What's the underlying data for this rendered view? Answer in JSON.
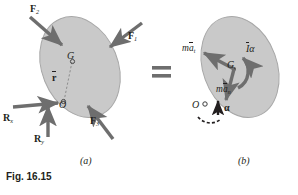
{
  "figure": {
    "caption": "Fig. 16.15",
    "part_a_label": "(a)",
    "part_b_label": "(b)",
    "equals_sign": "=",
    "colors": {
      "body_fill": "#c9c9c9",
      "body_stroke": "#9a9a9a",
      "arrow": "#6e6e6e",
      "text": "#231f20",
      "page_background": "#ffffff"
    }
  },
  "part_a": {
    "title": "(a)",
    "description": "Rigid body acted upon by external forces and reactions",
    "body_shape": "tilted-ellipse",
    "points": [
      {
        "name": "center-of-gravity",
        "label": "G"
      },
      {
        "name": "point-o",
        "label": "O"
      }
    ],
    "position_vector": {
      "label": "r",
      "overbar": true,
      "from": "O",
      "to": "G",
      "style": "dashed"
    },
    "forces": [
      {
        "name": "force-f2",
        "base": "F",
        "subscript": "2",
        "direction": "down-right"
      },
      {
        "name": "force-f1",
        "base": "F",
        "subscript": "1",
        "direction": "down-left"
      },
      {
        "name": "force-f3",
        "base": "F",
        "subscript": "3",
        "direction": "up-left"
      },
      {
        "name": "reaction-rx",
        "base": "R",
        "subscript": "x",
        "direction": "right"
      },
      {
        "name": "reaction-ry",
        "base": "R",
        "subscript": "y",
        "direction": "up"
      }
    ]
  },
  "part_b": {
    "title": "(b)",
    "description": "Equivalent system of effective forces and couple",
    "body_shape": "tilted-ellipse",
    "points": [
      {
        "name": "center-of-gravity",
        "label": "G"
      },
      {
        "name": "point-o",
        "label": "O"
      }
    ],
    "effective_forces": [
      {
        "name": "tangential-effective-force",
        "prefix": "m",
        "base": "a",
        "overbar": true,
        "subscript": "t",
        "direction": "up-left"
      },
      {
        "name": "normal-effective-force",
        "prefix": "m",
        "base": "a",
        "overbar": true,
        "subscript": "n",
        "direction": "down"
      }
    ],
    "effective_couple": {
      "name": "effective-couple",
      "base": "I",
      "overbar": true,
      "symbol": "α",
      "sense": "clockwise"
    },
    "angular_acceleration": {
      "name": "angular-acceleration",
      "symbol": "α",
      "bold": true,
      "direction": "up"
    }
  }
}
